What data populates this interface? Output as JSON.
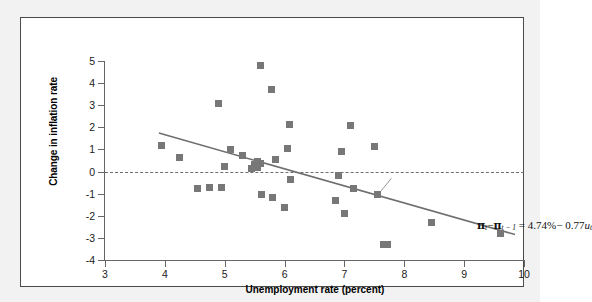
{
  "figure": {
    "axis_color": "#666666",
    "marker_color": "#777777",
    "line_color": "#6e6e6e"
  },
  "equation": {
    "pi_t": "π",
    "sub_t": "t",
    "sub_t_minus_1": "t − 1",
    "minus": "−",
    "equals": "=",
    "intercept": "4.74%",
    "slope_text": "0.77",
    "u_var": "u",
    "full_text": "πt − πt−1 = 4.74% − 0.77ut"
  },
  "chart_data": {
    "type": "scatter",
    "title": "",
    "xlabel": "Unemployment rate (percent)",
    "ylabel": "Change in inflation rate",
    "xlim": [
      3,
      10
    ],
    "ylim": [
      -4,
      5
    ],
    "xticks": [
      3,
      4,
      5,
      6,
      7,
      8,
      9,
      10
    ],
    "xticklabels": [
      "3",
      "4",
      "5",
      "6",
      "7",
      "8",
      "9",
      "10"
    ],
    "yticks": [
      5,
      4,
      3,
      2,
      1,
      0,
      -1,
      -2,
      -3,
      -4
    ],
    "yticklabels": [
      "5",
      "4",
      "3",
      "2",
      "1",
      "0",
      "-1",
      "-2",
      "-3",
      "-4"
    ],
    "grid": false,
    "legend": null,
    "zero_reference_line": {
      "y": 0,
      "style": "dashed"
    },
    "regression_line": {
      "label": "πt − πt−1 = 4.74% − 0.77ut",
      "intercept": 4.74,
      "slope": -0.77,
      "x_start": 3.9,
      "x_end": 9.85
    },
    "points": [
      {
        "x": 3.95,
        "y": 1.2
      },
      {
        "x": 4.25,
        "y": 0.65
      },
      {
        "x": 4.55,
        "y": -0.75
      },
      {
        "x": 4.75,
        "y": -0.72
      },
      {
        "x": 4.9,
        "y": 3.1
      },
      {
        "x": 4.95,
        "y": -0.72
      },
      {
        "x": 5.0,
        "y": 0.22
      },
      {
        "x": 5.1,
        "y": 0.98
      },
      {
        "x": 5.3,
        "y": 0.75
      },
      {
        "x": 5.45,
        "y": 0.15
      },
      {
        "x": 5.5,
        "y": 0.3
      },
      {
        "x": 5.55,
        "y": 0.45
      },
      {
        "x": 5.55,
        "y": 0.2
      },
      {
        "x": 5.6,
        "y": 0.35
      },
      {
        "x": 5.6,
        "y": 4.78
      },
      {
        "x": 5.62,
        "y": -1.05
      },
      {
        "x": 5.78,
        "y": 3.7
      },
      {
        "x": 5.8,
        "y": -1.18
      },
      {
        "x": 5.85,
        "y": 0.55
      },
      {
        "x": 6.0,
        "y": -1.62
      },
      {
        "x": 6.05,
        "y": 1.05
      },
      {
        "x": 6.08,
        "y": 2.12
      },
      {
        "x": 6.1,
        "y": -0.35
      },
      {
        "x": 6.85,
        "y": -1.32
      },
      {
        "x": 6.9,
        "y": -0.18
      },
      {
        "x": 6.95,
        "y": 0.92
      },
      {
        "x": 7.0,
        "y": -1.88
      },
      {
        "x": 7.1,
        "y": 2.08
      },
      {
        "x": 7.15,
        "y": -0.78
      },
      {
        "x": 7.5,
        "y": 1.12
      },
      {
        "x": 7.55,
        "y": -1.05
      },
      {
        "x": 7.65,
        "y": -3.3
      },
      {
        "x": 7.72,
        "y": -3.28
      },
      {
        "x": 8.45,
        "y": -2.3
      },
      {
        "x": 9.6,
        "y": -2.78
      }
    ]
  }
}
